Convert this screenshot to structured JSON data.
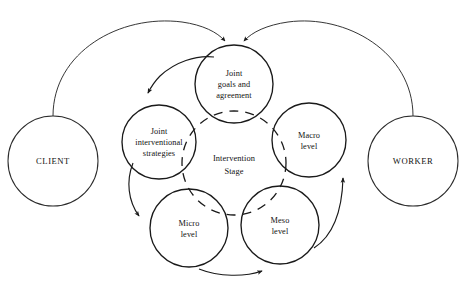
{
  "figure": {
    "caption": "",
    "background_color": "#ffffff",
    "line_color": "#1a1a1a"
  },
  "nodes": {
    "client": {
      "label": "CLIENT",
      "cx": 53,
      "cy": 161,
      "r": 45,
      "style": "outer"
    },
    "worker": {
      "label": "WORKER",
      "cx": 413,
      "cy": 161,
      "r": 45,
      "style": "outer"
    },
    "joint_goals": {
      "line1": "Joint",
      "line2": "goals and",
      "line3": "agreement",
      "cx": 234,
      "cy": 84,
      "r": 39,
      "style": "inner"
    },
    "joint_strategies": {
      "line1": "Joint",
      "line2": "interventional",
      "line3": "strategies",
      "cx": 159,
      "cy": 142,
      "r": 37,
      "style": "inner"
    },
    "macro": {
      "line1": "Macro",
      "line2": "level",
      "cx": 309,
      "cy": 140,
      "r": 37,
      "style": "inner"
    },
    "micro": {
      "line1": "Micro",
      "line2": "level",
      "cx": 189,
      "cy": 228,
      "r": 39,
      "style": "inner"
    },
    "meso": {
      "line1": "Meso",
      "line2": "level",
      "cx": 280,
      "cy": 225,
      "r": 39,
      "style": "inner"
    },
    "intervention_stage": {
      "line1": "Intervention",
      "line2": "Stage",
      "cx": 234,
      "cy": 163,
      "r": 52,
      "style": "dashed-center"
    }
  },
  "arrows": [
    {
      "name": "client-to-joint-goals",
      "from": "client",
      "to": "joint_goals",
      "description": "long curve from top of CLIENT up and right into top-left of Joint goals and agreement"
    },
    {
      "name": "worker-to-joint-goals",
      "from": "worker",
      "to": "joint_goals",
      "description": "long curve from top of WORKER up and left into top-right of Joint goals and agreement"
    },
    {
      "name": "joint-goals-to-joint-strategies",
      "from": "joint_goals",
      "to": "joint_strategies",
      "description": "short curve down-left from Joint goals to Joint interventional strategies"
    },
    {
      "name": "joint-strategies-to-micro",
      "from": "joint_strategies",
      "to": "micro",
      "description": "curve down-left from Joint interventional strategies to Micro level"
    },
    {
      "name": "micro-to-meso",
      "from": "micro",
      "to": "meso",
      "description": "curve along the bottom from Micro level to Meso level"
    },
    {
      "name": "meso-to-macro",
      "from": "meso",
      "to": "macro",
      "description": "curve up-right from Meso level to Macro level"
    }
  ]
}
